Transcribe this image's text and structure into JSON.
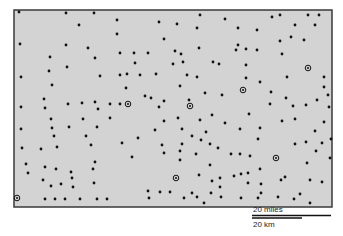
{
  "map": {
    "frame": {
      "x": 14,
      "y": 10,
      "width": 318,
      "height": 197,
      "fill": "#d3d3d3",
      "border": "#3a3a3a"
    },
    "dot_color": "#111111",
    "points": [
      [
        19,
        12
      ],
      [
        66,
        13
      ],
      [
        94,
        13
      ],
      [
        79,
        25
      ],
      [
        117,
        20
      ],
      [
        117,
        34
      ],
      [
        20,
        44
      ],
      [
        66,
        45
      ],
      [
        88,
        48
      ],
      [
        120,
        53
      ],
      [
        50,
        57
      ],
      [
        95,
        58
      ],
      [
        67,
        67
      ],
      [
        49,
        71
      ],
      [
        21,
        77
      ],
      [
        100,
        76
      ],
      [
        120,
        75
      ],
      [
        200,
        15
      ],
      [
        225,
        19
      ],
      [
        159,
        22
      ],
      [
        177,
        24
      ],
      [
        197,
        28
      ],
      [
        164,
        39
      ],
      [
        199,
        48
      ],
      [
        175,
        51
      ],
      [
        181,
        54
      ],
      [
        134,
        53
      ],
      [
        148,
        53
      ],
      [
        135,
        63
      ],
      [
        173,
        64
      ],
      [
        183,
        62
      ],
      [
        213,
        62
      ],
      [
        219,
        64
      ],
      [
        127,
        74
      ],
      [
        140,
        75
      ],
      [
        156,
        74
      ],
      [
        187,
        75
      ],
      [
        197,
        77
      ],
      [
        272,
        17
      ],
      [
        280,
        15
      ],
      [
        308,
        15
      ],
      [
        319,
        15
      ],
      [
        238,
        28
      ],
      [
        257,
        30
      ],
      [
        295,
        25
      ],
      [
        315,
        25
      ],
      [
        291,
        37
      ],
      [
        304,
        40
      ],
      [
        280,
        41
      ],
      [
        238,
        45
      ],
      [
        236,
        50
      ],
      [
        246,
        49
      ],
      [
        257,
        50
      ],
      [
        282,
        54
      ],
      [
        246,
        65
      ],
      [
        246,
        78
      ],
      [
        287,
        77
      ],
      [
        324,
        77
      ],
      [
        52,
        85
      ],
      [
        44,
        99
      ],
      [
        21,
        107
      ],
      [
        45,
        108
      ],
      [
        68,
        104
      ],
      [
        82,
        103
      ],
      [
        95,
        102
      ],
      [
        98,
        109
      ],
      [
        110,
        104
      ],
      [
        120,
        104
      ],
      [
        51,
        119
      ],
      [
        83,
        119
      ],
      [
        110,
        118
      ],
      [
        21,
        129
      ],
      [
        52,
        128
      ],
      [
        69,
        127
      ],
      [
        97,
        127
      ],
      [
        54,
        136
      ],
      [
        86,
        136
      ],
      [
        122,
        143
      ],
      [
        126,
        88
      ],
      [
        145,
        96
      ],
      [
        151,
        98
      ],
      [
        164,
        101
      ],
      [
        159,
        107
      ],
      [
        180,
        86
      ],
      [
        205,
        93
      ],
      [
        222,
        95
      ],
      [
        189,
        100
      ],
      [
        178,
        118
      ],
      [
        200,
        120
      ],
      [
        212,
        115
      ],
      [
        225,
        123
      ],
      [
        164,
        121
      ],
      [
        155,
        130
      ],
      [
        182,
        129
      ],
      [
        206,
        132
      ],
      [
        192,
        136
      ],
      [
        138,
        138
      ],
      [
        201,
        140
      ],
      [
        260,
        82
      ],
      [
        271,
        92
      ],
      [
        324,
        87
      ],
      [
        328,
        95
      ],
      [
        317,
        100
      ],
      [
        286,
        98
      ],
      [
        270,
        104
      ],
      [
        293,
        106
      ],
      [
        306,
        105
      ],
      [
        329,
        107
      ],
      [
        249,
        114
      ],
      [
        295,
        119
      ],
      [
        282,
        121
      ],
      [
        324,
        122
      ],
      [
        260,
        128
      ],
      [
        240,
        129
      ],
      [
        315,
        131
      ],
      [
        258,
        139
      ],
      [
        331,
        139
      ],
      [
        295,
        144
      ],
      [
        306,
        142
      ],
      [
        322,
        143
      ],
      [
        22,
        148
      ],
      [
        41,
        149
      ],
      [
        57,
        147
      ],
      [
        91,
        145
      ],
      [
        26,
        164
      ],
      [
        45,
        167
      ],
      [
        56,
        169
      ],
      [
        28,
        173
      ],
      [
        71,
        172
      ],
      [
        95,
        162
      ],
      [
        93,
        169
      ],
      [
        72,
        178
      ],
      [
        43,
        180
      ],
      [
        94,
        183
      ],
      [
        61,
        184
      ],
      [
        51,
        186
      ],
      [
        73,
        187
      ],
      [
        45,
        199
      ],
      [
        55,
        199
      ],
      [
        65,
        199
      ],
      [
        80,
        199
      ],
      [
        97,
        199
      ],
      [
        107,
        199
      ],
      [
        162,
        145
      ],
      [
        182,
        144
      ],
      [
        210,
        144
      ],
      [
        218,
        148
      ],
      [
        132,
        157
      ],
      [
        164,
        153
      ],
      [
        180,
        151
      ],
      [
        196,
        154
      ],
      [
        180,
        160
      ],
      [
        210,
        165
      ],
      [
        199,
        175
      ],
      [
        220,
        178
      ],
      [
        212,
        181
      ],
      [
        148,
        191
      ],
      [
        160,
        192
      ],
      [
        170,
        192
      ],
      [
        192,
        193
      ],
      [
        211,
        193
      ],
      [
        220,
        187
      ],
      [
        149,
        198
      ],
      [
        184,
        198
      ],
      [
        197,
        197
      ],
      [
        221,
        197
      ],
      [
        204,
        203
      ],
      [
        316,
        151
      ],
      [
        330,
        158
      ],
      [
        231,
        154
      ],
      [
        240,
        154
      ],
      [
        250,
        156
      ],
      [
        307,
        163
      ],
      [
        260,
        169
      ],
      [
        234,
        176
      ],
      [
        241,
        174
      ],
      [
        248,
        173
      ],
      [
        285,
        177
      ],
      [
        281,
        180
      ],
      [
        310,
        180
      ],
      [
        322,
        182
      ],
      [
        248,
        183
      ],
      [
        261,
        184
      ],
      [
        261,
        193
      ],
      [
        300,
        194
      ],
      [
        241,
        198
      ],
      [
        258,
        198
      ],
      [
        278,
        197
      ],
      [
        294,
        199
      ],
      [
        310,
        203
      ]
    ],
    "circled_points": [
      [
        128,
        104
      ],
      [
        190,
        106
      ],
      [
        243,
        90
      ],
      [
        308,
        68
      ],
      [
        276,
        158
      ],
      [
        176,
        178
      ],
      [
        17,
        198
      ]
    ]
  },
  "scale_bar": {
    "miles_label": "20 miles",
    "km_label": "20 km",
    "miles_line": {
      "x1": 252,
      "x2": 331,
      "y": 215.5
    },
    "km_line": {
      "x1": 252,
      "x2": 302,
      "y": 218
    }
  }
}
